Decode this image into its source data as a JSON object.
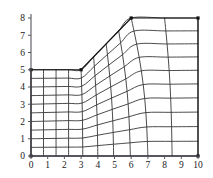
{
  "figure": {
    "title": "",
    "background_color": "#ffffff",
    "axis_color": "#55555c",
    "mesh_color": "#2b2b2b",
    "boundary_color": "#141414",
    "marker_color": "#111111"
  },
  "axes": {
    "x_label": "",
    "y_label": "",
    "x_ticks": [
      "0",
      "1",
      "2",
      "3",
      "4",
      "5",
      "6",
      "7",
      "8",
      "9",
      "10"
    ],
    "y_ticks": [
      "0",
      "1",
      "2",
      "3",
      "4",
      "5",
      "6",
      "7",
      "8"
    ],
    "x_range": [
      0,
      10
    ],
    "y_range": [
      0,
      8
    ],
    "grid": false
  },
  "chart_data": {
    "type": "line",
    "xlabel": "",
    "ylabel": "",
    "xlim": [
      0,
      10
    ],
    "ylim": [
      0,
      8
    ],
    "x": [
      0,
      1,
      2,
      3,
      4,
      5,
      6,
      7,
      8,
      9,
      10
    ],
    "categories": [
      "0",
      "1",
      "2",
      "3",
      "4",
      "5",
      "6",
      "7",
      "8",
      "9",
      "10"
    ],
    "values": [
      0,
      0,
      0,
      0,
      0,
      0,
      0,
      0,
      0,
      0,
      0
    ],
    "grid": false,
    "legend": "none",
    "domain_description": "Mesh region bounded below by y=0 from x=0 to x=10, left by x=0 from y=0 to y=5, top-left by y=5 from x=0 to x=3, a slanted edge from (3,5) to (6,8), top by y=8 from x=6 to x=10, and right by x=10 from y=8 down to y=0.",
    "boundary_polygon": [
      [
        0,
        0
      ],
      [
        10,
        0
      ],
      [
        10,
        8
      ],
      [
        6,
        8
      ],
      [
        3,
        5
      ],
      [
        0,
        5
      ],
      [
        0,
        0
      ]
    ],
    "corner_markers": [
      [
        6,
        8
      ],
      [
        10,
        8
      ],
      [
        0,
        0
      ],
      [
        10,
        0
      ],
      [
        0,
        5
      ],
      [
        3,
        5
      ]
    ],
    "mesh": {
      "n_columns": 10,
      "n_rows": 10,
      "bottom_edge": [
        [
          0,
          0
        ],
        [
          10,
          0
        ]
      ],
      "top_edge": [
        [
          0,
          5
        ],
        [
          3,
          5
        ],
        [
          6,
          8
        ],
        [
          10,
          8
        ]
      ],
      "left_edge": [
        [
          0,
          0
        ],
        [
          0,
          5
        ]
      ],
      "right_edge": [
        [
          10,
          0
        ],
        [
          10,
          8
        ]
      ],
      "top_nodes_x": [
        0,
        0.75,
        1.5,
        2.25,
        3.0,
        3.75,
        4.5,
        5.25,
        6.0,
        8.0,
        10.0
      ],
      "top_nodes_y": [
        5,
        5,
        5,
        5,
        5.0,
        5.75,
        6.5,
        7.25,
        8.0,
        8.0,
        8.0
      ],
      "bottom_nodes_x": [
        0,
        0.75,
        1.5,
        2.25,
        3.1,
        4.0,
        4.95,
        5.95,
        7.0,
        8.45,
        10.0
      ],
      "bottom_nodes_y": [
        0,
        0,
        0,
        0,
        0,
        0,
        0,
        0,
        0,
        0,
        0
      ],
      "row_fractions": [
        0,
        0.1,
        0.2,
        0.3,
        0.4,
        0.5,
        0.6,
        0.7,
        0.8,
        0.9,
        1.0
      ]
    }
  },
  "plot_geometry": {
    "left_px": 31,
    "right_px": 198,
    "top_px": 18,
    "bottom_px": 156,
    "y_top_value": 8,
    "y_bottom_value": 0,
    "x_left_value": 0,
    "x_right_value": 10
  }
}
